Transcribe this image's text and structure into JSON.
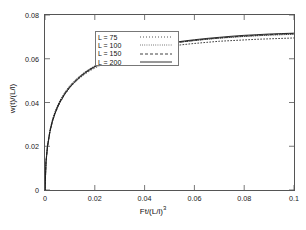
{
  "chart_data": {
    "type": "line",
    "title": "",
    "xlabel": "Ft/(L/l)^3",
    "xlabel_base": "Ft/(L/l)",
    "xlabel_exponent": "3",
    "ylabel": "w(t)/(L/l)",
    "xlim": [
      0,
      0.1
    ],
    "ylim": [
      0,
      0.08
    ],
    "xticks": [
      "0",
      "0.02",
      "0.04",
      "0.06",
      "0.08",
      "0.1"
    ],
    "xtick_values": [
      0,
      0.02,
      0.04,
      0.06,
      0.08,
      0.1
    ],
    "yticks": [
      "0",
      "0.02",
      "0.04",
      "0.06",
      "0.08"
    ],
    "ytick_values": [
      0,
      0.02,
      0.04,
      0.06,
      0.08
    ],
    "grid": false,
    "legend_position": "top-left",
    "series": [
      {
        "name": "L = 75",
        "label": "L = 75",
        "style": "dotted",
        "color": "#2b2b2b",
        "x": [
          0,
          0.0004,
          0.001,
          0.002,
          0.003,
          0.004,
          0.005,
          0.006,
          0.008,
          0.01,
          0.012,
          0.014,
          0.016,
          0.018,
          0.02,
          0.024,
          0.028,
          0.032,
          0.036,
          0.04,
          0.045,
          0.05,
          0.055,
          0.06,
          0.065,
          0.07,
          0.075,
          0.08,
          0.085,
          0.09,
          0.095,
          0.1
        ],
        "y": [
          0.0,
          0.0128,
          0.0198,
          0.0268,
          0.0314,
          0.0348,
          0.0376,
          0.04,
          0.0438,
          0.0468,
          0.0492,
          0.0512,
          0.053,
          0.0545,
          0.0558,
          0.058,
          0.0598,
          0.0613,
          0.0626,
          0.0636,
          0.0648,
          0.0657,
          0.0664,
          0.067,
          0.0675,
          0.068,
          0.0683,
          0.0686,
          0.0689,
          0.0691,
          0.0693,
          0.0695
        ]
      },
      {
        "name": "L = 100",
        "label": "L = 100",
        "style": "dotted-fine",
        "color": "#2b2b2b",
        "x": [
          0,
          0.0004,
          0.001,
          0.002,
          0.003,
          0.004,
          0.005,
          0.006,
          0.008,
          0.01,
          0.012,
          0.014,
          0.016,
          0.018,
          0.02,
          0.024,
          0.028,
          0.032,
          0.036,
          0.04,
          0.045,
          0.05,
          0.055,
          0.06,
          0.065,
          0.07,
          0.075,
          0.08,
          0.085,
          0.09,
          0.095,
          0.1
        ],
        "y": [
          0.0,
          0.0132,
          0.0204,
          0.0275,
          0.0322,
          0.0357,
          0.0385,
          0.0409,
          0.0447,
          0.0477,
          0.0501,
          0.0521,
          0.0539,
          0.0554,
          0.0567,
          0.059,
          0.0609,
          0.0624,
          0.0637,
          0.0648,
          0.066,
          0.0669,
          0.0677,
          0.0683,
          0.0689,
          0.0694,
          0.0698,
          0.0702,
          0.0705,
          0.0708,
          0.071,
          0.0712
        ]
      },
      {
        "name": "L = 150",
        "label": "L = 150",
        "style": "dashed",
        "color": "#2b2b2b",
        "x": [
          0,
          0.0004,
          0.001,
          0.002,
          0.003,
          0.004,
          0.005,
          0.006,
          0.008,
          0.01,
          0.012,
          0.014,
          0.016,
          0.018,
          0.02,
          0.024,
          0.028,
          0.032,
          0.036,
          0.04,
          0.045,
          0.05,
          0.055,
          0.06,
          0.065,
          0.07,
          0.075,
          0.08,
          0.085,
          0.09,
          0.095,
          0.1
        ],
        "y": [
          0.0,
          0.013,
          0.0201,
          0.0272,
          0.0319,
          0.0353,
          0.0381,
          0.0405,
          0.0443,
          0.0473,
          0.0497,
          0.0518,
          0.0536,
          0.0551,
          0.0564,
          0.0588,
          0.0607,
          0.0623,
          0.0636,
          0.0647,
          0.0659,
          0.0669,
          0.0677,
          0.0684,
          0.069,
          0.0695,
          0.07,
          0.0704,
          0.0707,
          0.071,
          0.0713,
          0.0715
        ]
      },
      {
        "name": "L = 200",
        "label": "L = 200",
        "style": "solid",
        "color": "#1a1a1a",
        "x": [
          0,
          0.0004,
          0.001,
          0.002,
          0.003,
          0.004,
          0.005,
          0.006,
          0.008,
          0.01,
          0.012,
          0.014,
          0.016,
          0.018,
          0.02,
          0.024,
          0.028,
          0.032,
          0.036,
          0.04,
          0.045,
          0.05,
          0.055,
          0.06,
          0.065,
          0.07,
          0.075,
          0.08,
          0.085,
          0.09,
          0.095,
          0.1
        ],
        "y": [
          0.0,
          0.0126,
          0.0196,
          0.0266,
          0.0313,
          0.0348,
          0.0376,
          0.04,
          0.0439,
          0.047,
          0.0495,
          0.0516,
          0.0534,
          0.055,
          0.0564,
          0.0588,
          0.0608,
          0.0624,
          0.0638,
          0.0649,
          0.0661,
          0.0671,
          0.068,
          0.0687,
          0.0693,
          0.0698,
          0.0703,
          0.0707,
          0.071,
          0.0713,
          0.0715,
          0.0717
        ]
      }
    ]
  }
}
